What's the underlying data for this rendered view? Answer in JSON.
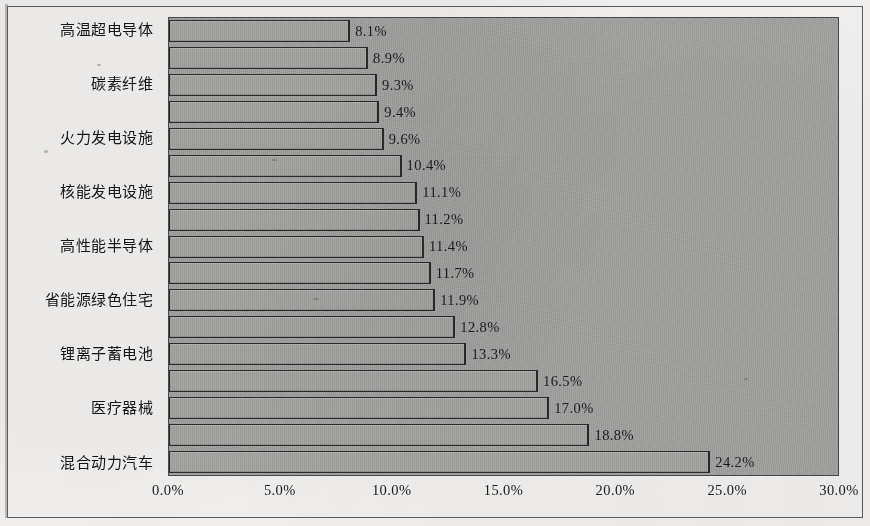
{
  "chart_data": {
    "type": "bar",
    "orientation": "horizontal",
    "title": "",
    "subtitle": "",
    "xlabel": "",
    "ylabel": "",
    "xlim": [
      0,
      30
    ],
    "xticks": [
      "0.0%",
      "5.0%",
      "10.0%",
      "15.0%",
      "20.0%",
      "25.0%",
      "30.0%"
    ],
    "xtick_values": [
      0,
      5,
      10,
      15,
      20,
      25,
      30
    ],
    "grid": false,
    "legend": null,
    "bar_count": 17,
    "categories": [
      "高温超电导体",
      "",
      "碳素纤维",
      "",
      "火力发电设施",
      "",
      "核能发电设施",
      "",
      "高性能半导体",
      "",
      "省能源绿色住宅",
      "",
      "锂离子蓄电池",
      "",
      "医疗器械",
      "",
      "混合动力汽车"
    ],
    "values": [
      8.1,
      8.9,
      9.3,
      9.4,
      9.6,
      10.4,
      11.1,
      11.2,
      11.4,
      11.7,
      11.9,
      12.8,
      13.3,
      16.5,
      17.0,
      18.8,
      24.2
    ],
    "data_labels": [
      "8.1%",
      "8.9%",
      "9.3%",
      "9.4%",
      "9.6%",
      "10.4%",
      "11.1%",
      "11.2%",
      "11.4%",
      "11.7%",
      "11.9%",
      "12.8%",
      "13.3%",
      "16.5%",
      "17.0%",
      "18.8%",
      "24.2%"
    ],
    "visible_category_labels": [
      "高温超电导体",
      "碳素纤维",
      "火力发电设施",
      "核能发电设施",
      "高性能半导体",
      "省能源绿色住宅",
      "锂离子蓄电池",
      "医疗器械",
      "混合动力汽车"
    ],
    "colors": {
      "plot_background": "#a5a5a3",
      "bar_fill": "#a9a8a5",
      "bar_border": "#2b2b2b",
      "page_background": "#f3f2f0",
      "frame_border": "#5d5d5d",
      "text": "#1b1b1b"
    }
  }
}
